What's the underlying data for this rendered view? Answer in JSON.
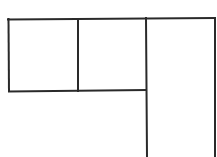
{
  "diagram": {
    "stroke_color": "#2a2a2a",
    "background": "#ffffff",
    "cells": [
      {
        "name": "top-left-cell",
        "x": 8,
        "y": 19,
        "w": 70,
        "h": 72
      },
      {
        "name": "top-middle-cell",
        "x": 78,
        "y": 19,
        "w": 68,
        "h": 72
      },
      {
        "name": "right-column",
        "x": 146,
        "y": 18,
        "w": 69,
        "h": 139
      }
    ]
  }
}
